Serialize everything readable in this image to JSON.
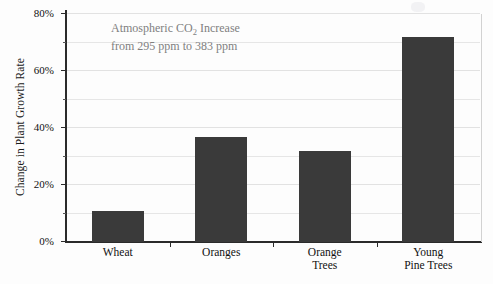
{
  "chart_data": {
    "type": "bar",
    "title": "",
    "categories": [
      "Wheat",
      "Oranges",
      "Orange Trees",
      "Young Pine Trees"
    ],
    "category_lines": [
      [
        "Wheat"
      ],
      [
        "Oranges"
      ],
      [
        "Orange",
        "Trees"
      ],
      [
        "Young",
        "Pine Trees"
      ]
    ],
    "values": [
      11,
      37,
      32,
      72
    ],
    "xlabel": "",
    "ylabel": "Change in Plant Growth Rate",
    "ylim": [
      0,
      80
    ],
    "ytick_labels": [
      "0%",
      "20%",
      "40%",
      "60%",
      "80%"
    ],
    "ytick_values": [
      0,
      20,
      40,
      60,
      80
    ],
    "minor_tick_values": [
      10,
      30,
      50,
      70
    ],
    "gridline_values": [
      10,
      20,
      30,
      40,
      50,
      60,
      70,
      80
    ],
    "grid": true,
    "legend": "none",
    "bar_color": "#3a3a3a",
    "annotation": {
      "line1_part1": "Atmospheric CO",
      "line1_sub": "2",
      "line1_part2": " Increase",
      "line2": "from 295 ppm to 383 ppm",
      "color": "#808080"
    }
  }
}
